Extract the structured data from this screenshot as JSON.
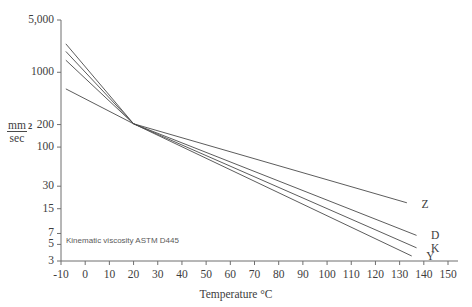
{
  "chart_data": {
    "type": "line",
    "title": "",
    "subtitle": "",
    "caption": "Kinematic viscosity ASTM D445",
    "xlabel": "Temperature °C",
    "ylabel_numerator": "mm",
    "ylabel_exponent": "2",
    "ylabel_denominator": "sec",
    "ylabel": "mm2/sec",
    "grid": false,
    "legend_position": "right-inline",
    "xlim": [
      -10,
      150
    ],
    "ylim": [
      3,
      5000
    ],
    "yscale": "log",
    "xticks": [
      -10,
      0,
      10,
      20,
      30,
      40,
      50,
      60,
      70,
      80,
      90,
      100,
      110,
      120,
      130,
      140,
      150
    ],
    "xticklabels": [
      "-10",
      "0",
      "10",
      "20",
      "30",
      "40",
      "50",
      "60",
      "70",
      "80",
      "90",
      "100",
      "110",
      "120",
      "130",
      "140",
      "150"
    ],
    "yticks": [
      5000,
      1000,
      200,
      100,
      30,
      15,
      7,
      5,
      3
    ],
    "yticklabels": [
      "5,000",
      "1000",
      "200",
      "100",
      "30",
      "15",
      "7",
      "5",
      "3"
    ],
    "series": [
      {
        "name": "Z",
        "label": "Z",
        "color": "#4a4a4a",
        "x": [
          -8,
          20,
          133
        ],
        "y": [
          600,
          205,
          18
        ]
      },
      {
        "name": "D",
        "label": "D",
        "color": "#4a4a4a",
        "x": [
          -8,
          20,
          137
        ],
        "y": [
          1450,
          205,
          6.6
        ]
      },
      {
        "name": "K",
        "label": "K",
        "color": "#4a4a4a",
        "x": [
          -8,
          20,
          137
        ],
        "y": [
          1900,
          205,
          4.5
        ]
      },
      {
        "name": "Y",
        "label": "Y",
        "color": "#4a4a4a",
        "x": [
          -8,
          20,
          135
        ],
        "y": [
          2400,
          205,
          3.5
        ]
      }
    ],
    "annotations": [
      {
        "text": "Z",
        "x": 139,
        "y": 17
      },
      {
        "text": "D",
        "x": 143,
        "y": 6.4
      },
      {
        "text": "K",
        "x": 143,
        "y": 4.4
      },
      {
        "text": "Y",
        "x": 141,
        "y": 3.4
      }
    ]
  },
  "axes": {
    "y_axis_name": "viscosity-axis",
    "x_axis_name": "temperature-axis"
  }
}
